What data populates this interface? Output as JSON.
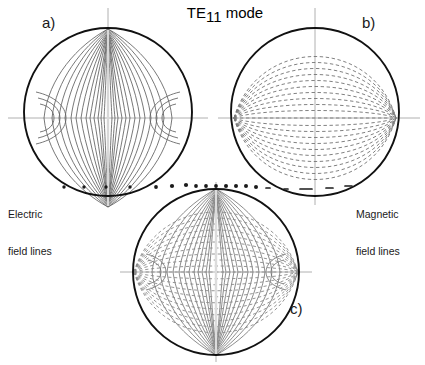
{
  "figure": {
    "width": 425,
    "height": 365,
    "background": "#ffffff",
    "title": {
      "base": "TE",
      "subscript": "11",
      "suffix": " mode",
      "full": "TE11 mode"
    },
    "panels": [
      {
        "id": "a",
        "tag": "a)",
        "tag_pos": {
          "x": 42,
          "y": 14
        },
        "circle": {
          "cx": 108,
          "cy": 112,
          "r": 84
        },
        "content": "electric-field-lines",
        "line_style": "solid",
        "line_color": "#555555",
        "outline_color": "#111111"
      },
      {
        "id": "b",
        "tag": "b)",
        "tag_pos": {
          "x": 362,
          "y": 14
        },
        "circle": {
          "cx": 315,
          "cy": 112,
          "r": 84
        },
        "content": "magnetic-field-lines",
        "line_style": "dashed",
        "line_color": "#777777",
        "outline_color": "#111111"
      },
      {
        "id": "c",
        "tag": "c)",
        "tag_pos": {
          "x": 290,
          "y": 300
        },
        "circle": {
          "cx": 216,
          "cy": 272,
          "r": 83
        },
        "content": "electric-and-magnetic-field-lines",
        "line_style": "solid-and-dashed",
        "line_color": "#666666",
        "outline_color": "#111111"
      }
    ],
    "legends": [
      {
        "id": "electric",
        "line1": "Electric",
        "line2": "field lines",
        "pos": {
          "x": 8,
          "y": 183
        }
      },
      {
        "id": "magnetic",
        "line1": "Magnetic",
        "line2": "field lines",
        "pos": {
          "x": 356,
          "y": 183
        }
      }
    ],
    "axes": {
      "color": "#aaaaaa",
      "description": "thin grey horizontal and vertical reference axes through each circle centre"
    },
    "leader_lines": {
      "color": "#1a1a1a",
      "electric_marker_dots": 4,
      "magnetic_marker_dots": 5,
      "description": "dotted/dashed leader lines pointing from each legend toward the corresponding field lines"
    }
  }
}
